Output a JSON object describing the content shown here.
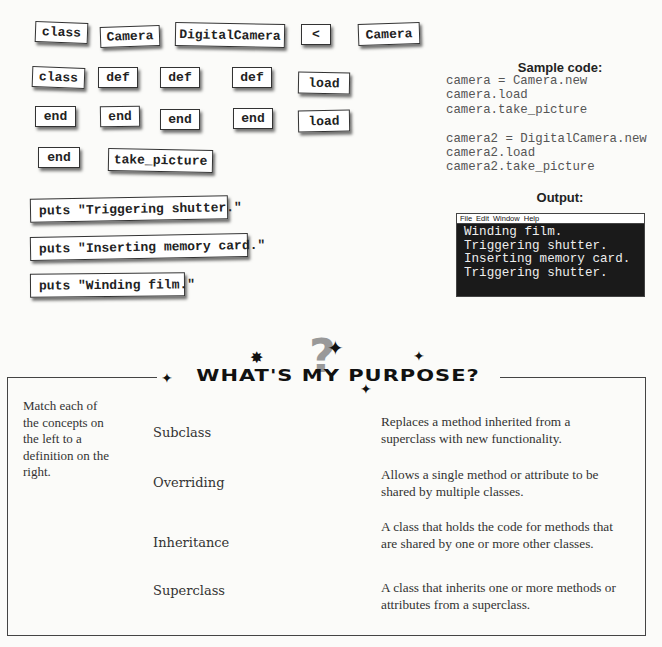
{
  "magnets": {
    "row1": [
      "class",
      "Camera",
      "DigitalCamera",
      "<",
      "Camera"
    ],
    "row2": [
      "class",
      "def",
      "def",
      "def",
      "load"
    ],
    "row3": [
      "end",
      "end",
      "end",
      "end",
      "load"
    ],
    "row4": [
      "end",
      "take_picture"
    ],
    "puts": [
      "puts \"Triggering shutter.\"",
      "puts \"Inserting memory card.\"",
      "puts \"Winding film.\""
    ]
  },
  "sample": {
    "title": "Sample code:",
    "code": "camera = Camera.new\ncamera.load\ncamera.take_picture\n\ncamera2 = DigitalCamera.new\ncamera2.load\ncamera2.take_picture"
  },
  "output": {
    "title": "Output:",
    "menu": [
      "File",
      "Edit",
      "Window",
      "Help"
    ],
    "lines": "Winding film.\nTriggering shutter.\nInserting memory card.\nTriggering shutter."
  },
  "purpose": {
    "heading": "WHAT'S MY PURPOSE?",
    "question_mark": "?",
    "instructions": "Match each of the concepts on the left to a definition on the right.",
    "concepts": [
      "Subclass",
      "Overriding",
      "Inheritance",
      "Superclass"
    ],
    "definitions": [
      "Replaces a method inherited from a superclass with new functionality.",
      "Allows a single method or attribute to be shared by multiple classes.",
      "A class that holds the code for methods that are shared by one or more other classes.",
      "A class that inherits one or more methods or attributes from a superclass."
    ]
  }
}
